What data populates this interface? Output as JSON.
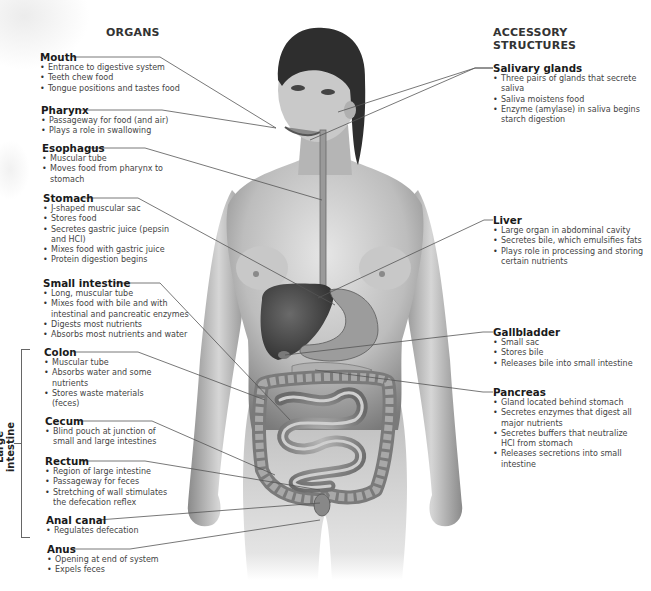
{
  "headers": {
    "organs": "ORGANS",
    "accessory": "ACCESSORY STRUCTURES"
  },
  "group_labels": {
    "large_intestine": "Large intestine"
  },
  "organs": [
    {
      "name": "Mouth",
      "bullets": [
        "Entrance to digestive system",
        "Teeth chew food",
        "Tongue positions and tastes food"
      ]
    },
    {
      "name": "Pharynx",
      "bullets": [
        "Passageway for food (and air)",
        "Plays a role in swallowing"
      ]
    },
    {
      "name": "Esophagus",
      "bullets": [
        "Muscular tube",
        "Moves food from pharynx to stomach"
      ]
    },
    {
      "name": "Stomach",
      "bullets": [
        "J-shaped muscular sac",
        "Stores food",
        "Secretes gastric juice (pepsin and HCl)",
        "Mixes food with gastric juice",
        "Protein digestion begins"
      ]
    },
    {
      "name": "Small intestine",
      "bullets": [
        "Long, muscular tube",
        "Mixes food with bile and with intestinal and pancreatic enzymes",
        "Digests most nutrients",
        "Absorbs most nutrients and water"
      ]
    },
    {
      "name": "Colon",
      "bullets": [
        "Muscular tube",
        "Absorbs water and some nutrients",
        "Stores waste materials (feces)"
      ]
    },
    {
      "name": "Cecum",
      "bullets": [
        "Blind pouch at junction of small and large intestines"
      ]
    },
    {
      "name": "Rectum",
      "bullets": [
        "Region of large intestine",
        "Passageway for feces",
        "Stretching of wall stimulates the defecation reflex"
      ]
    },
    {
      "name": "Anal canal",
      "bullets": [
        "Regulates defecation"
      ]
    },
    {
      "name": "Anus",
      "bullets": [
        "Opening at end of system",
        "Expels feces"
      ]
    }
  ],
  "accessory": [
    {
      "name": "Salivary glands",
      "bullets": [
        "Three pairs of glands that secrete saliva",
        "Saliva moistens food",
        "Enzyme (amylase) in saliva begins starch digestion"
      ]
    },
    {
      "name": "Liver",
      "bullets": [
        "Large organ in abdominal cavity",
        "Secretes bile, which emulsifies fats",
        "Plays role in processing and storing certain nutrients"
      ]
    },
    {
      "name": "Gallbladder",
      "bullets": [
        "Small sac",
        "Stores bile",
        "Releases bile into small intestine"
      ]
    },
    {
      "name": "Pancreas",
      "bullets": [
        "Gland located behind stomach",
        "Secretes enzymes that digest all major nutrients",
        "Secretes buffers that neutralize HCl from stomach",
        "Releases secretions into small intestine"
      ]
    }
  ],
  "figure": {
    "colors": {
      "skin_light": "#d9d9d9",
      "skin_mid": "#a8a8a8",
      "skin_dark": "#6e6e6e",
      "organ_dark": "#3a3a3a",
      "organ_mid": "#8c8c8c",
      "hair": "#2e2e2e",
      "leader_line": "#555555"
    }
  }
}
